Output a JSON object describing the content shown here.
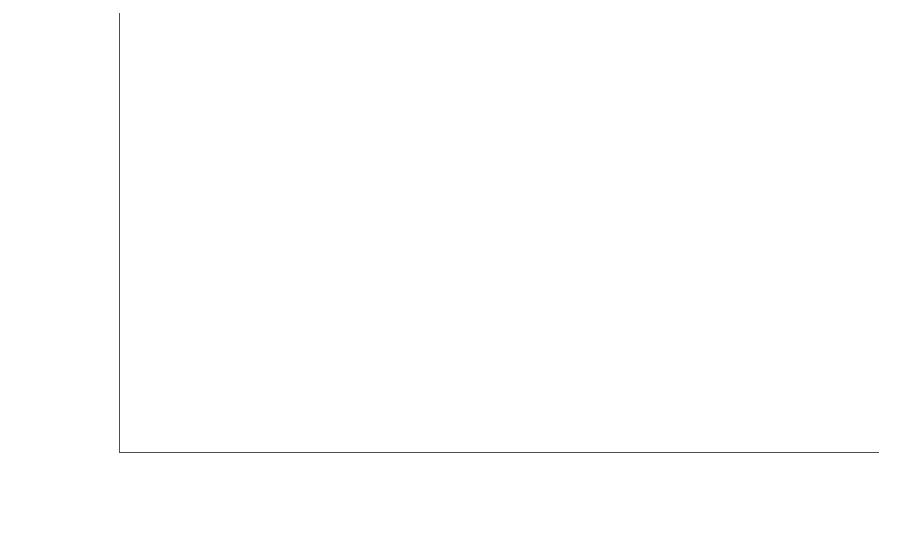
{
  "chart_data": {
    "type": "bar",
    "subtype": "stacked-vertical",
    "title": "",
    "xlabel": "",
    "ylabel": "Beneficiaries",
    "categories": [
      "2009",
      "2010",
      "2011",
      "2012",
      "2013"
    ],
    "ylim": [
      0,
      350000
    ],
    "ytick_values": [
      0,
      50000,
      100000,
      150000,
      200000,
      250000,
      300000,
      350000
    ],
    "ytick_labels": [
      "0",
      "50,000",
      "100,000",
      "150,000",
      "200,000",
      "250,000",
      "300,000",
      "350,000"
    ],
    "grid": false,
    "legend_position": "bottom-center",
    "series": [
      {
        "name": "Employed private sector workers",
        "color": "#595959",
        "stack_position": "top",
        "values": [
          235311,
          218647,
          187476,
          123761,
          166800
        ],
        "labels": [
          "235,311",
          "218,647",
          "187,476",
          "123,761",
          "166,800"
        ]
      },
      {
        "name": "Vulnerable and unemployed population",
        "color": "#b8b8b8",
        "stack_position": "bottom",
        "values": [
          75857,
          90362,
          76375,
          82077,
          114000
        ],
        "labels": [
          "75,857",
          "90,362",
          "76,375",
          "82,077",
          "114,000"
        ]
      }
    ],
    "totals": [
      311168,
      309009,
      263851,
      205838,
      280800
    ]
  },
  "legend": {
    "items": [
      {
        "label": "Employed private sector workers",
        "swatch": "dark-gray-swatch-icon"
      },
      {
        "label": "Vulnerable and unemployed population",
        "swatch": "light-gray-swatch-icon"
      }
    ]
  },
  "colors": {
    "employed_private_sector_workers": "#595959",
    "vulnerable_and_unemployed_population": "#b8b8b8",
    "axis": "#4d4d4d",
    "text": "#1a1a1a",
    "background": "#ffffff"
  }
}
